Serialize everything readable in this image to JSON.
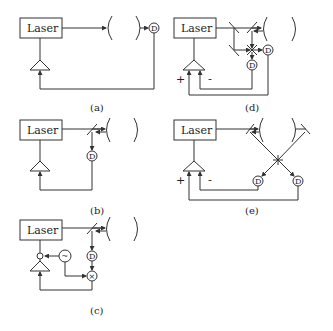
{
  "diagram": {
    "laser_label": "Laser",
    "detector_label": "D",
    "mixer_symbol": "×",
    "oscillator_symbol": "~",
    "plus_sign": "+",
    "minus_sign": "-",
    "panels": [
      {
        "id": "a",
        "caption": "(a)",
        "description": "Transmission lock: laser to cavity, detector after cavity, feedback via amplifier"
      },
      {
        "id": "b",
        "caption": "(b)",
        "description": "Reflection lock: beam splitter before cavity, reflected light to detector, feedback via amplifier"
      },
      {
        "id": "c",
        "caption": "(c)",
        "description": "Modulation lock: oscillator modulates laser, detector signal mixed with oscillator, fed to amplifier"
      },
      {
        "id": "d",
        "caption": "(d)",
        "description": "Polarization / balanced detection scheme with two detectors and differential amplifier (+/-)"
      },
      {
        "id": "e",
        "caption": "(e)",
        "description": "Two-mirror crossed scheme with two detectors feeding differential amplifier (+/-)"
      }
    ]
  }
}
